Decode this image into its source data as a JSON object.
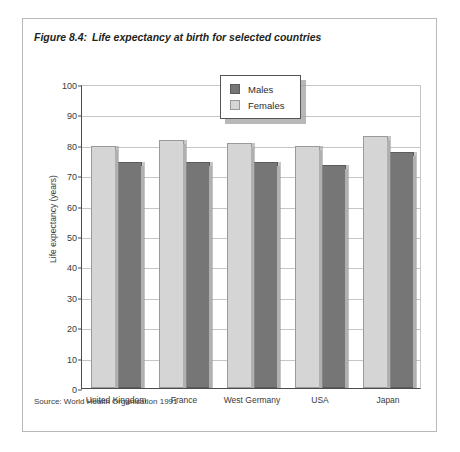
{
  "figure": {
    "number": "Figure 8.4:",
    "title": "Life expectancy at birth for selected countries",
    "source": "Source: World Health Organisation 1991"
  },
  "legend": {
    "entries": [
      {
        "label": "Males",
        "color": "#767676",
        "swatch": "males"
      },
      {
        "label": "Females",
        "color": "#d5d5d5",
        "swatch": "females"
      }
    ]
  },
  "axis": {
    "y_ticks": [
      "100",
      "90",
      "80",
      "70",
      "60",
      "50",
      "40",
      "30",
      "20",
      "10",
      "0"
    ],
    "y_title": "Life expectancy (years)"
  },
  "chart_data": {
    "type": "bar",
    "title": "Life expectancy at birth for selected countries",
    "subtitle": "",
    "xlabel": "",
    "ylabel": "Life expectancy (years)",
    "ylim": [
      0,
      100
    ],
    "ytick_step": 10,
    "grid": true,
    "legend_position": "top-center",
    "bar_order": [
      "Females",
      "Males"
    ],
    "categories": [
      "United Kingdom",
      "France",
      "West Germany",
      "USA",
      "Japan"
    ],
    "series": [
      {
        "name": "Females",
        "color": "#d5d5d5",
        "values": [
          79.5,
          81.5,
          80.5,
          79.5,
          83.0
        ]
      },
      {
        "name": "Males",
        "color": "#767676",
        "values": [
          74.5,
          74.5,
          74.5,
          73.5,
          77.5
        ]
      }
    ],
    "annotations": [
      "Source: World Health Organisation 1991"
    ]
  }
}
